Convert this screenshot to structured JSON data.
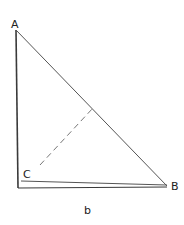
{
  "figure": {
    "type": "geometry-triangle",
    "stroke_color": "#3a3a3a",
    "labels": {
      "A": "A",
      "B": "B",
      "C": "C",
      "caption": "b"
    },
    "points": {
      "A": [
        16,
        30
      ],
      "B": [
        167,
        186
      ],
      "C": [
        21,
        181
      ],
      "corner": [
        18,
        188
      ]
    },
    "dashed_segment": {
      "from": [
        40,
        165
      ],
      "to": [
        93,
        108
      ]
    }
  }
}
